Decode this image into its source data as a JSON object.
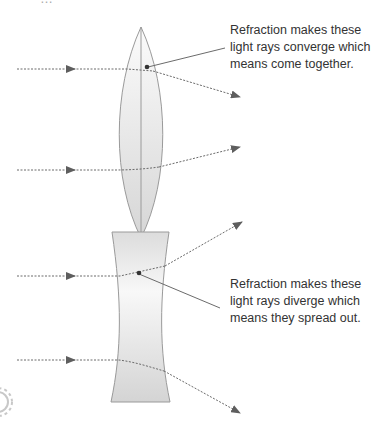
{
  "header": {
    "title_cutoff": "…"
  },
  "diagram": {
    "convex_lens": {
      "name": "converging lens",
      "caption": [
        "Refraction makes these",
        "light rays converge which",
        "means come together."
      ]
    },
    "concave_lens": {
      "name": "diverging lens",
      "caption": [
        "Refraction makes these",
        "light rays diverge which",
        "means they spread out."
      ]
    },
    "colors": {
      "ray": "#6b6b6b",
      "lens_stroke": "#9a9a9a",
      "lens_fill_light": "#f7f7f7",
      "lens_fill_dark": "#d9d9d9",
      "text": "#333333"
    },
    "decorations": {
      "corner_fragment": "gear-fragment"
    }
  }
}
